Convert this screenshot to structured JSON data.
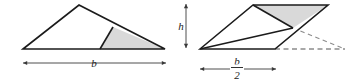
{
  "figure": {
    "colors": {
      "stroke": "#1b1b1b",
      "shade_fill": "#d9d9d9",
      "white_fill": "#ffffff",
      "dashed": "#8c8c8c",
      "background": "#ffffff"
    },
    "left": {
      "name": "triangle-figure",
      "outline_points": "23,49 79,5 165,49",
      "shaded_points": "113,27 100,49 165,49",
      "inner_line": "113,27 100,49",
      "base_label": "b",
      "base_label_x": 94,
      "base_label_y": 67,
      "dimension_arrow": {
        "x1": 23,
        "x2": 166,
        "y": 63
      }
    },
    "right": {
      "name": "parallelogram-figure",
      "outline_points": "200,49 253,5 328,5 275,49",
      "shaded_points": "253,5 328,5 293,28",
      "inner_line": "253,5 293,28",
      "diagonal_line": "200,49 293,28",
      "base_label_numerator": "b",
      "base_label_denominator": "2",
      "base_label_x": 237,
      "dimension_arrow": {
        "x1": 200,
        "x2": 276,
        "y": 69
      },
      "height_label": "h",
      "height_arrow": {
        "x": 186,
        "y1": 4,
        "y2": 48
      },
      "dashed_horizontal": "275,49 345,49",
      "dashed_diagonal": "293,28 345,49"
    }
  }
}
